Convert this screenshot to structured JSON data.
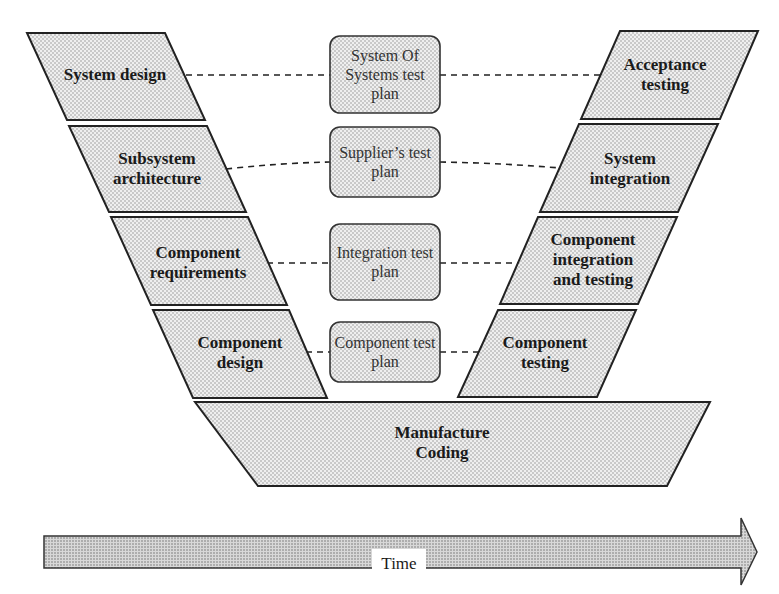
{
  "diagram": {
    "type": "V-model",
    "left_arm": [
      {
        "label": "System design"
      },
      {
        "label": "Subsystem architecture"
      },
      {
        "label": "Component requirements"
      },
      {
        "label": "Component design"
      }
    ],
    "test_plans": [
      {
        "label": "System Of Systems test plan"
      },
      {
        "label": "Supplier’s test plan"
      },
      {
        "label": "Integration test plan"
      },
      {
        "label": "Component test plan"
      }
    ],
    "right_arm": [
      {
        "label": "Acceptance testing"
      },
      {
        "label": "System integration"
      },
      {
        "label": "Component integration and testing"
      },
      {
        "label": "Component testing"
      }
    ],
    "bottom": {
      "label_line1": "Manufacture",
      "label_line2": "Coding"
    },
    "time_arrow": {
      "label": "Time"
    }
  }
}
